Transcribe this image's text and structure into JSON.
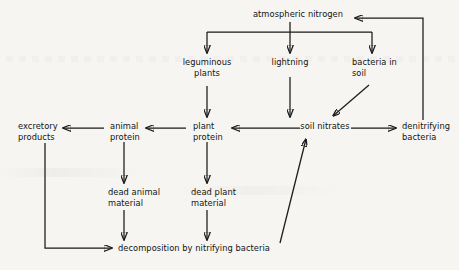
{
  "diagram": {
    "background_color": "#f6f5f1",
    "ink_color": "#1b1b1b",
    "nodes": {
      "atmospheric_nitrogen": "atmospheric nitrogen",
      "leguminous_plants": "leguminous\nplants",
      "lightning": "lightning",
      "bacteria_in_soil": "bacteria in\nsoil",
      "excretory_products": "excretory\nproducts",
      "animal_protein": "animal\nprotein",
      "plant_protein": "plant\nprotein",
      "soil_nitrates": "soil nitrates",
      "denitrifying_bacteria": "denitrifying\nbacteria",
      "dead_animal_material": "dead animal\nmaterial",
      "dead_plant_material": "dead plant\nmaterial",
      "decomposition": "decomposition by nitrifying bacteria"
    },
    "edges": [
      {
        "id": "atm-to-leguminous",
        "from": "atmospheric_nitrogen",
        "to": "leguminous_plants"
      },
      {
        "id": "atm-to-lightning",
        "from": "atmospheric_nitrogen",
        "to": "lightning"
      },
      {
        "id": "atm-to-bacteria-soil",
        "from": "atmospheric_nitrogen",
        "to": "bacteria_in_soil"
      },
      {
        "id": "leguminous-to-plant-protein",
        "from": "leguminous_plants",
        "to": "plant_protein"
      },
      {
        "id": "lightning-to-soil-nitrates",
        "from": "lightning",
        "to": "soil_nitrates"
      },
      {
        "id": "bacteria-soil-to-soil-nitrates",
        "from": "bacteria_in_soil",
        "to": "soil_nitrates"
      },
      {
        "id": "soil-nitrates-to-plant-protein",
        "from": "soil_nitrates",
        "to": "plant_protein"
      },
      {
        "id": "plant-protein-to-animal-protein",
        "from": "plant_protein",
        "to": "animal_protein"
      },
      {
        "id": "animal-protein-to-excretory",
        "from": "animal_protein",
        "to": "excretory_products"
      },
      {
        "id": "soil-nitrates-to-denitrifying",
        "from": "soil_nitrates",
        "to": "denitrifying_bacteria"
      },
      {
        "id": "denitrifying-to-atmospheric",
        "from": "denitrifying_bacteria",
        "to": "atmospheric_nitrogen"
      },
      {
        "id": "animal-protein-to-dead-animal",
        "from": "animal_protein",
        "to": "dead_animal_material"
      },
      {
        "id": "plant-protein-to-dead-plant",
        "from": "plant_protein",
        "to": "dead_plant_material"
      },
      {
        "id": "dead-animal-to-decomposition",
        "from": "dead_animal_material",
        "to": "decomposition"
      },
      {
        "id": "dead-plant-to-decomposition",
        "from": "dead_plant_material",
        "to": "decomposition"
      },
      {
        "id": "excretory-to-decomposition",
        "from": "excretory_products",
        "to": "decomposition"
      },
      {
        "id": "decomposition-to-soil-nitrates",
        "from": "decomposition",
        "to": "soil_nitrates"
      }
    ]
  }
}
